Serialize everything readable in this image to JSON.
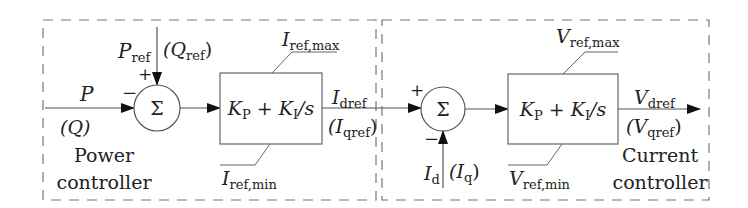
{
  "diagram": {
    "power_controller": {
      "title_line1": "Power",
      "title_line2": "controller",
      "input": {
        "main": "P",
        "alt": "(Q)"
      },
      "reference": {
        "main_sym": "P",
        "main_sub": "ref",
        "alt_open": "(Q",
        "alt_sub": "ref",
        "alt_close": ")"
      },
      "sum_symbol": "Σ",
      "sum_plus": "+",
      "sum_minus": "−",
      "block": {
        "kp": "K",
        "kp_sub": "P",
        "plus": " + ",
        "ki": "K",
        "ki_sub": "I",
        "tail": "/s"
      },
      "limit_max": {
        "sym": "I",
        "sub": "ref,max"
      },
      "limit_min": {
        "sym": "I",
        "sub": "ref,min"
      },
      "output": {
        "main_sym": "I",
        "main_sub": "dref",
        "alt_open": "(I",
        "alt_sub": "qref",
        "alt_close": ")"
      }
    },
    "current_controller": {
      "title_line1": "Current",
      "title_line2": "controller",
      "sum_symbol": "Σ",
      "sum_plus": "+",
      "sum_minus": "−",
      "feedback": {
        "main_sym": "I",
        "main_sub": "d",
        "alt_open": "(I",
        "alt_sub": "q",
        "alt_close": ")"
      },
      "block": {
        "kp": "K",
        "kp_sub": "P",
        "plus": " + ",
        "ki": "K",
        "ki_sub": "I",
        "tail": "/s"
      },
      "limit_max": {
        "sym": "V",
        "sub": "ref,max"
      },
      "limit_min": {
        "sym": "V",
        "sub": "ref,min"
      },
      "output": {
        "main_sym": "V",
        "main_sub": "dref",
        "alt_open": "(V",
        "alt_sub": "qref",
        "alt_close": ")"
      }
    },
    "colors": {
      "line": "#555555",
      "dash": "#777777",
      "text": "#222222"
    }
  }
}
